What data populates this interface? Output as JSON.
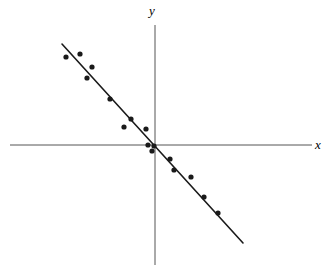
{
  "figure": {
    "width": 331,
    "height": 275,
    "background_color": "#ffffff",
    "ink_color": "#1a1a1a",
    "axis_color": "#555555"
  },
  "labels": {
    "x_axis": "x",
    "y_axis": "y"
  },
  "chart_data": {
    "type": "scatter",
    "title": "",
    "subtitle": "",
    "xlabel": "x",
    "ylabel": "y",
    "grid": false,
    "legend": null,
    "annotations": [],
    "axis_style": "cartesian-cross-no-ticks",
    "xlim": [
      -10,
      10
    ],
    "ylim": [
      -10,
      10
    ],
    "origin_pixel": [
      155,
      145
    ],
    "units_per_pixel": 0.1,
    "points_pixel": [
      [
        66,
        57
      ],
      [
        80,
        54
      ],
      [
        92,
        67
      ],
      [
        87,
        78
      ],
      [
        110,
        99
      ],
      [
        131,
        119
      ],
      [
        124,
        127
      ],
      [
        146,
        129
      ],
      [
        148,
        145
      ],
      [
        152,
        151
      ],
      [
        154,
        146
      ],
      [
        170,
        159
      ],
      [
        174,
        170
      ],
      [
        191,
        177
      ],
      [
        204,
        197
      ],
      [
        218,
        213
      ]
    ],
    "x": [
      -8.9,
      -7.5,
      -6.3,
      -6.8,
      -4.5,
      -2.4,
      -3.1,
      -0.9,
      -0.7,
      -0.3,
      -0.1,
      1.5,
      1.9,
      3.6,
      4.9,
      6.3
    ],
    "y": [
      8.8,
      9.1,
      7.8,
      6.7,
      4.6,
      2.6,
      1.8,
      1.6,
      0.0,
      -0.6,
      -0.1,
      -1.4,
      -2.5,
      -3.2,
      -5.2,
      -6.8
    ],
    "point_count": 16,
    "point_radius_px": 2.6,
    "fit_line": {
      "label": "least-squares regression line",
      "slope": -1.0,
      "intercept": 0.0,
      "start_pixel": [
        62,
        44
      ],
      "end_pixel": [
        243,
        243
      ],
      "stroke_width_px": 1.6,
      "color": "#1a1a1a"
    },
    "axes_pixel": {
      "x_axis": {
        "x1": 10,
        "y1": 145,
        "x2": 312,
        "y2": 145
      },
      "y_axis": {
        "x1": 155,
        "y1": 25,
        "x2": 155,
        "y2": 265
      }
    }
  }
}
